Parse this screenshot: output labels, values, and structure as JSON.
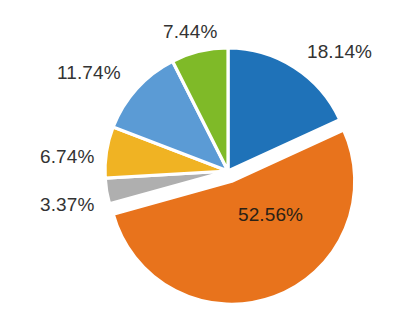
{
  "chart_data": {
    "type": "pie",
    "title": "",
    "subtitle": "",
    "xlabel": "",
    "ylabel": "",
    "legend": "none",
    "grid": false,
    "total_label": "99.99%",
    "units": "%",
    "start_angle_deg": 0,
    "direction": "clockwise",
    "categories": [
      "Slice 1",
      "Slice 2",
      "Slice 3",
      "Slice 4",
      "Slice 5",
      "Slice 6"
    ],
    "values": [
      18.14,
      52.56,
      3.37,
      6.74,
      11.74,
      7.44
    ],
    "labels": [
      "18.14%",
      "52.56%",
      "3.37%",
      "6.74%",
      "11.74%",
      "7.44%"
    ],
    "colors": [
      "#1f72b8",
      "#e8731c",
      "#afafaf",
      "#f0b323",
      "#5b9bd5",
      "#7fba28"
    ],
    "slices": [
      {
        "label": "18.14%",
        "value": 18.14,
        "color": "#1f72b8",
        "color_name": "dark-blue",
        "exploded": false,
        "label_position": "outside-right"
      },
      {
        "label": "52.56%",
        "value": 52.56,
        "color": "#e8731c",
        "color_name": "orange",
        "exploded": true,
        "label_position": "inside"
      },
      {
        "label": "3.37%",
        "value": 3.37,
        "color": "#afafaf",
        "color_name": "gray",
        "exploded": false,
        "label_position": "outside-left"
      },
      {
        "label": "6.74%",
        "value": 6.74,
        "color": "#f0b323",
        "color_name": "yellow",
        "exploded": false,
        "label_position": "outside-left"
      },
      {
        "label": "11.74%",
        "value": 11.74,
        "color": "#5b9bd5",
        "color_name": "light-blue",
        "exploded": false,
        "label_position": "outside-upper-left"
      },
      {
        "label": "7.44%",
        "value": 7.44,
        "color": "#7fba28",
        "color_name": "green",
        "exploded": false,
        "label_position": "outside-top"
      }
    ]
  },
  "style": {
    "background": "#ffffff",
    "separator_color": "#ffffff",
    "label_color": "#333333",
    "inner_label_color": "#2b2115"
  }
}
